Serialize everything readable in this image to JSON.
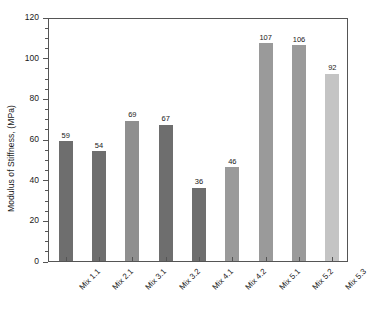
{
  "chart_data": {
    "type": "bar",
    "title": "",
    "xlabel": "",
    "ylabel": "Modulus of Stiffness, (MPa)",
    "categories": [
      "Mix 1.1",
      "Mix 2.1",
      "Mix 3.1",
      "Mix 3.2",
      "Mix 4.1",
      "Mix 4.2",
      "Mix 5.1",
      "Mix 5.2",
      "Mix 5.3"
    ],
    "values": [
      59,
      54,
      69,
      67,
      36,
      46,
      107,
      106,
      92
    ],
    "bar_colors": [
      "#6e6e6e",
      "#6e6e6e",
      "#8f8f8f",
      "#6e6e6e",
      "#6e6e6e",
      "#9a9a9a",
      "#9a9a9a",
      "#9a9a9a",
      "#c4c4c4"
    ],
    "ylim": [
      0,
      120
    ],
    "yticks": [
      0,
      20,
      40,
      60,
      80,
      100,
      120
    ],
    "ytick_labels": [
      "0",
      "20",
      "40",
      "60",
      "80",
      "100",
      "120"
    ],
    "minor_tick_step": 5,
    "grid": false,
    "legend": null,
    "show_value_labels": true,
    "frame": "box",
    "axis_color": "#555555",
    "background": "#ffffff"
  }
}
